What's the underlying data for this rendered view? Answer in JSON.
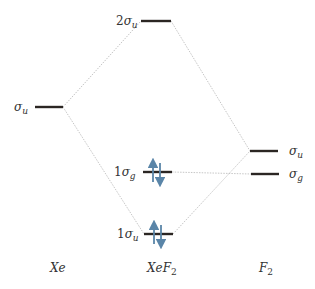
{
  "diagram": {
    "type": "molecular-orbital-diagram",
    "colors": {
      "level": "#2b2623",
      "connector": "#b8b8b8",
      "electron_arrow": "#5a85a8",
      "text": "#333333"
    },
    "columns": [
      {
        "id": "xe",
        "label_base": "Xe",
        "label_sub": ""
      },
      {
        "id": "xef2",
        "label_base": "XeF",
        "label_sub": "2"
      },
      {
        "id": "f2",
        "label_base": "F",
        "label_sub": "2"
      }
    ],
    "levels": [
      {
        "id": "xe-sigma-u",
        "column": "xe",
        "prefix": "",
        "symbol": "σ",
        "sub": "u",
        "electrons": 0
      },
      {
        "id": "xef2-2sigma-u",
        "column": "xef2",
        "prefix": "2",
        "symbol": "σ",
        "sub": "u",
        "electrons": 0
      },
      {
        "id": "xef2-1sigma-g",
        "column": "xef2",
        "prefix": "1",
        "symbol": "σ",
        "sub": "g",
        "electrons": 2
      },
      {
        "id": "xef2-1sigma-u",
        "column": "xef2",
        "prefix": "1",
        "symbol": "σ",
        "sub": "u",
        "electrons": 2
      },
      {
        "id": "f2-sigma-u",
        "column": "f2",
        "prefix": "",
        "symbol": "σ",
        "sub": "u",
        "electrons": 0
      },
      {
        "id": "f2-sigma-g",
        "column": "f2",
        "prefix": "",
        "symbol": "σ",
        "sub": "g",
        "electrons": 0
      }
    ],
    "connections": [
      {
        "from": "xe-sigma-u",
        "to": "xef2-2sigma-u"
      },
      {
        "from": "xe-sigma-u",
        "to": "xef2-1sigma-u"
      },
      {
        "from": "xef2-2sigma-u",
        "to": "f2-sigma-u"
      },
      {
        "from": "xef2-1sigma-u",
        "to": "f2-sigma-u"
      },
      {
        "from": "xef2-1sigma-g",
        "to": "f2-sigma-g"
      }
    ]
  }
}
